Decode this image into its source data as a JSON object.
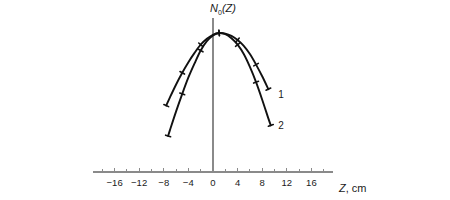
{
  "chart_data": {
    "type": "line",
    "title": "",
    "xlabel": "Z, cm",
    "ylabel": "N₀(Z)",
    "ylabel_base": "N",
    "ylabel_sub": "0",
    "ylabel_arg": "(Z)",
    "xlim": [
      -19.5,
      19.5
    ],
    "ylim": [
      0,
      1.12
    ],
    "grid": false,
    "legend_position": "right-of-curve-ends",
    "x_major_ticks": [
      -16,
      -12,
      -8,
      -4,
      0,
      4,
      8,
      12,
      16
    ],
    "x_major_tick_labels": [
      "−16",
      "−12",
      "−8",
      "−4",
      "0",
      "4",
      "8",
      "12",
      "16"
    ],
    "x_minor_ticks": [
      -18,
      -14,
      -10,
      -6,
      -2,
      2,
      6,
      10,
      14,
      18
    ],
    "y_axis_ticks": [],
    "y_axis_tick_labels": [],
    "annotations": [
      {
        "text": "1",
        "x": 10.6,
        "y": 0.46
      },
      {
        "text": "2",
        "x": 10.6,
        "y": 0.2
      }
    ],
    "series": [
      {
        "name": "1",
        "label": "1",
        "color": "#111111",
        "x": [
          -7.6,
          -7.0,
          -6.0,
          -5.0,
          -4.0,
          -3.0,
          -2.0,
          -1.0,
          0.0,
          1.0,
          2.0,
          3.0,
          4.0,
          5.0,
          6.0,
          7.0,
          8.0,
          9.0
        ],
        "y": [
          0.38,
          0.45,
          0.56,
          0.66,
          0.75,
          0.83,
          0.9,
          0.95,
          0.985,
          1.0,
          0.995,
          0.975,
          0.94,
          0.89,
          0.82,
          0.73,
          0.63,
          0.52
        ],
        "marker_x": [
          -7.6,
          -5.0,
          -2.0,
          1.0,
          4.0,
          7.0,
          9.0
        ]
      },
      {
        "name": "2",
        "label": "2",
        "color": "#111111",
        "x": [
          -7.3,
          -7.0,
          -6.0,
          -5.0,
          -4.0,
          -3.0,
          -2.0,
          -1.0,
          0.0,
          1.0,
          2.0,
          3.0,
          4.0,
          5.0,
          6.0,
          7.0,
          8.0,
          9.0,
          9.4
        ],
        "y": [
          0.12,
          0.17,
          0.33,
          0.48,
          0.62,
          0.74,
          0.85,
          0.93,
          0.98,
          1.0,
          0.99,
          0.955,
          0.9,
          0.82,
          0.71,
          0.58,
          0.43,
          0.27,
          0.21
        ],
        "marker_x": [
          -7.3,
          -5.0,
          -2.0,
          1.0,
          4.0,
          7.0,
          9.4
        ]
      }
    ]
  },
  "axis_style": {
    "axis_color": "#8a8a8a",
    "curve_color": "#111111",
    "text_color": "#1a1a1a",
    "background": "#ffffff"
  }
}
